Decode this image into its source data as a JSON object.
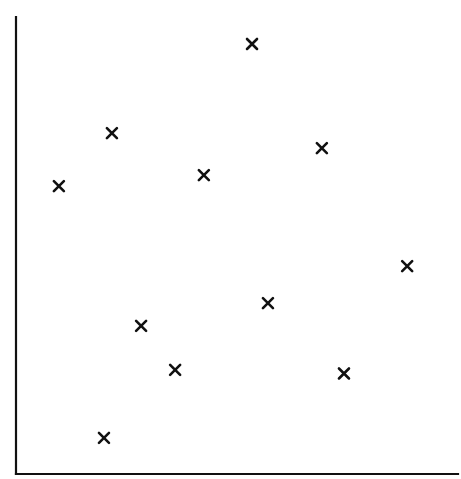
{
  "chart_data": {
    "type": "scatter",
    "title": "",
    "xlabel": "",
    "ylabel": "",
    "xlim": [
      0,
      100
    ],
    "ylim": [
      0,
      100
    ],
    "grid": false,
    "legend": null,
    "ticks": {
      "x": [],
      "y": []
    },
    "marker": "x",
    "marker_color": "#111111",
    "axes_color": "#111111",
    "series": [
      {
        "name": "points",
        "points": [
          {
            "x": 9.7,
            "y": 63.0
          },
          {
            "x": 21.7,
            "y": 74.6
          },
          {
            "x": 42.5,
            "y": 65.4
          },
          {
            "x": 53.4,
            "y": 94.1
          },
          {
            "x": 69.2,
            "y": 71.3
          },
          {
            "x": 88.5,
            "y": 45.5
          },
          {
            "x": 57.0,
            "y": 37.4
          },
          {
            "x": 28.3,
            "y": 32.4
          },
          {
            "x": 36.0,
            "y": 22.8
          },
          {
            "x": 74.2,
            "y": 22.0
          },
          {
            "x": 19.9,
            "y": 7.9
          }
        ]
      }
    ]
  }
}
